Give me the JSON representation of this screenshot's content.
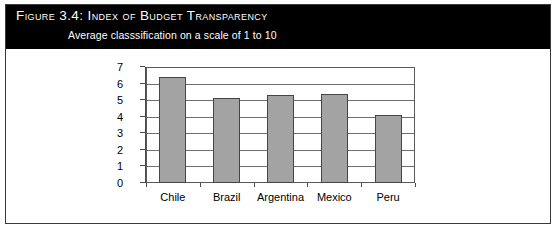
{
  "figure": {
    "title": "Figure 3.4:  Index of Budget Transparency",
    "subtitle": "Average classsification on a scale of 1 to 10"
  },
  "colors": {
    "header_background": "#000000",
    "header_text": "#ffffff",
    "bar_fill": "#a3a3a3",
    "bar_border": "#454545",
    "gridline": "#6e6e6e",
    "frame_border": "#3a3a3a",
    "page_background": "#ffffff"
  },
  "chart_data": {
    "type": "bar",
    "title": "Index of Budget Transparency",
    "subtitle": "Average classsification on a scale of 1 to 10",
    "categories": [
      "Chile",
      "Brazil",
      "Argentina",
      "Mexico",
      "Peru"
    ],
    "values": [
      6.4,
      5.1,
      5.3,
      5.35,
      4.1
    ],
    "xlabel": "",
    "ylabel": "",
    "ylim": [
      0,
      7
    ],
    "yticks": [
      0,
      1,
      2,
      3,
      4,
      5,
      6,
      7
    ],
    "ytick_labels": [
      "0",
      "1",
      "2",
      "3",
      "4",
      "5",
      "6",
      "7"
    ],
    "grid": true,
    "legend": false,
    "orientation": "vertical"
  }
}
